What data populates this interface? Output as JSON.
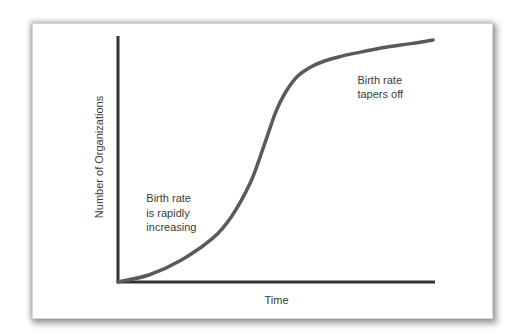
{
  "chart_data": {
    "type": "line",
    "title": "",
    "xlabel": "Time",
    "ylabel": "Number of Organizations",
    "xlim": [
      0,
      1
    ],
    "ylim": [
      0,
      1
    ],
    "grid": false,
    "legend": null,
    "series": [
      {
        "name": "Number of Organizations",
        "color": "#5a5a5a",
        "x": [
          0.0,
          0.1,
          0.2,
          0.3,
          0.36,
          0.42,
          0.46,
          0.5,
          0.53,
          0.57,
          0.63,
          0.7,
          0.77,
          0.85,
          0.93,
          1.0
        ],
        "y": [
          0.0,
          0.03,
          0.09,
          0.18,
          0.27,
          0.41,
          0.55,
          0.7,
          0.78,
          0.85,
          0.9,
          0.93,
          0.95,
          0.97,
          0.985,
          1.0
        ]
      }
    ],
    "annotations": [
      {
        "id": "early",
        "lines": [
          "Birth rate",
          "is rapidly",
          "increasing"
        ],
        "x": 0.09,
        "y": 0.33
      },
      {
        "id": "late",
        "lines": [
          "Birth rate",
          "tapers off"
        ],
        "x": 0.76,
        "y": 0.82
      }
    ]
  }
}
